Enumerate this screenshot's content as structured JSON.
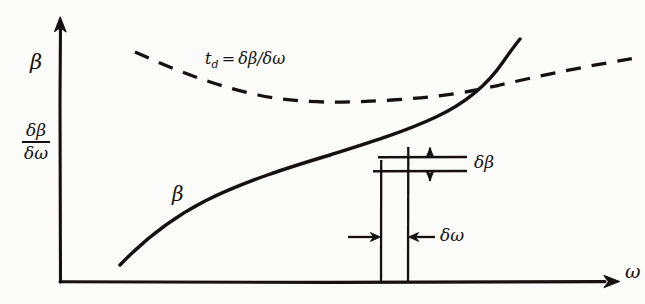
{
  "figure": {
    "background_color": "#fbfbfa",
    "ink_color": "#14110f",
    "style": "hand-drawn scanned line diagram"
  },
  "axes": {
    "y_axis_name": "β",
    "y_axis_ratio_numerator": "δβ",
    "y_axis_ratio_denominator": "δω",
    "x_axis_name": "ω",
    "x_axis_arrow": "arrow-right",
    "y_axis_arrow": "arrow-up",
    "origin_x": 60,
    "origin_y": 282,
    "x_axis_end": 618,
    "y_axis_top": 18
  },
  "curves": {
    "solid": {
      "label": "β",
      "style": "solid",
      "description": "phase constant rising, concave down then inflecting steeply upward",
      "start": [
        120,
        265
      ],
      "end": [
        520,
        40
      ]
    },
    "dashed": {
      "label_prefix": "t",
      "label_subscript": "d",
      "label_equals": "=",
      "label_expression": "δβ/δω",
      "label_full": "t_d = δβ/δω",
      "style": "dashed",
      "description": "group delay curve falling to a broad minimum then rising",
      "start": [
        135,
        52
      ],
      "minimum": [
        355,
        101
      ],
      "end": [
        641,
        58
      ]
    },
    "intersection": [
      495,
      78
    ]
  },
  "construction": {
    "vertical_left_x": 381,
    "vertical_right_x": 408,
    "vertical_top_y": 157,
    "vertical_bottom_y": 282,
    "horizontal_upper_y": 157,
    "horizontal_lower_y": 171,
    "horizontal_left_x": 378,
    "horizontal_right_x": 467
  },
  "annotations": {
    "delta_beta_label": "δβ",
    "delta_beta_arrow": "double-headed-vertical-arrow",
    "delta_beta_arrow_x": 430,
    "delta_omega_label": "δω",
    "delta_omega_arrow": "inward-pointing-horizontal-arrows",
    "delta_omega_arrow_y": 237
  }
}
